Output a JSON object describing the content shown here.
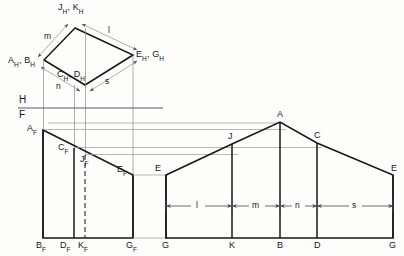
{
  "figure": {
    "background_color": "#fdfdfb",
    "line_color": "#17171a",
    "projector_color": "#8d8d92"
  },
  "top_view": {
    "name": "horizontal-projection",
    "vertices": {
      "jk": {
        "label_j": "J",
        "label_k": "K",
        "sub": "H",
        "x": 75,
        "y": 28
      },
      "ab": {
        "label_a": "A",
        "label_b": "B",
        "sub": "H",
        "x": 44,
        "y": 60
      },
      "cd": {
        "label_c": "C",
        "label_d": "D",
        "sub": "H",
        "x": 85,
        "y": 85
      },
      "eg": {
        "label_e": "E",
        "label_g": "G",
        "sub": "H",
        "x": 133,
        "y": 55
      }
    },
    "labels": {
      "jk": "J",
      "jk2": "K",
      "ab": "A",
      "ab2": "B",
      "cd": "C",
      "cd2": "D",
      "eg": "E",
      "eg2": "G",
      "subscript": "H",
      "comma": ","
    },
    "dimensions": [
      {
        "name": "m",
        "text": "m"
      },
      {
        "name": "l",
        "text": "l"
      },
      {
        "name": "n",
        "text": "n"
      },
      {
        "name": "s",
        "text": "s"
      }
    ]
  },
  "fold_line": {
    "name": "hf-reference-line",
    "upper": "H",
    "lower": "F",
    "y": 108
  },
  "front_view": {
    "name": "frontal-projection",
    "points": [
      {
        "label": "A",
        "sub": "F",
        "x": 43,
        "y": 130
      },
      {
        "label": "C",
        "sub": "F",
        "x": 74,
        "y": 148
      },
      {
        "label": "J",
        "sub": "F",
        "x": 85,
        "y": 155
      },
      {
        "label": "E",
        "sub": "F",
        "x": 133,
        "y": 175
      },
      {
        "label": "B",
        "sub": "F",
        "x": 43,
        "y": 238
      },
      {
        "label": "D",
        "sub": "F",
        "x": 74,
        "y": 238
      },
      {
        "label": "K",
        "sub": "F",
        "x": 85,
        "y": 238
      },
      {
        "label": "G",
        "sub": "F",
        "x": 133,
        "y": 238
      }
    ]
  },
  "development_view": {
    "name": "true-shape-development",
    "top_points": [
      {
        "label": "E",
        "x": 166,
        "y": 175
      },
      {
        "label": "J",
        "x": 232,
        "y": 144
      },
      {
        "label": "A",
        "x": 280,
        "y": 122
      },
      {
        "label": "C",
        "x": 317,
        "y": 143
      },
      {
        "label": "E",
        "x": 393,
        "y": 175
      }
    ],
    "bottom_points": [
      {
        "label": "G",
        "x": 166,
        "y": 238
      },
      {
        "label": "K",
        "x": 232,
        "y": 238
      },
      {
        "label": "B",
        "x": 280,
        "y": 238
      },
      {
        "label": "D",
        "x": 317,
        "y": 238
      },
      {
        "label": "G",
        "x": 393,
        "y": 238
      }
    ],
    "dimension_chain": [
      {
        "name": "l",
        "text": "l",
        "from": 166,
        "to": 232
      },
      {
        "name": "m",
        "text": "m",
        "from": 232,
        "to": 280
      },
      {
        "name": "n",
        "text": "n",
        "from": 280,
        "to": 317
      },
      {
        "name": "s",
        "text": "s",
        "from": 317,
        "to": 393
      }
    ],
    "dimension_line_y": 206
  }
}
